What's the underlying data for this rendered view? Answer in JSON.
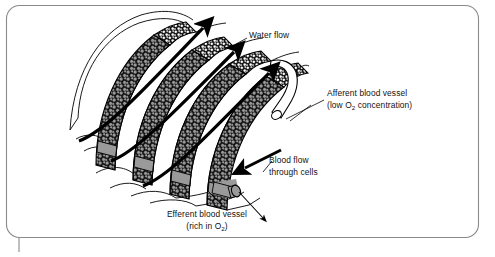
{
  "figure": {
    "name": "fish-gill-lamellae-diagram",
    "background_color": "#ffffff",
    "border_color": "#8a8a8a",
    "ink_color": "#000000",
    "cell_fill_gray": "#9a9a9a",
    "cell_fill_white": "#ffffff",
    "vessel_gray": "#9a9a9a",
    "lamella_band_black": "#111111"
  },
  "labels": {
    "water_flow": "Water flow",
    "afferent_line1": "Afferent blood vessel",
    "afferent_line2_pre": "(low O",
    "afferent_sub": "2",
    "afferent_line2_post": " concentration)",
    "blood_flow_line1": "Blood flow",
    "blood_flow_line2": "through cells",
    "efferent_line1": "Efferent blood vessel",
    "efferent_line2_pre": "(rich in O",
    "efferent_sub": "2",
    "efferent_line2_post": ")"
  },
  "arrows": {
    "water_flow_count": 3,
    "water_flow_direction": "up-right",
    "blood_flow_direction": "down-left",
    "efferent_out_direction": "down-right"
  },
  "structures": {
    "lamellae_count": 4,
    "afferent_vessel": "white tube, upper right",
    "efferent_vessel": "gray tube, lower right"
  }
}
